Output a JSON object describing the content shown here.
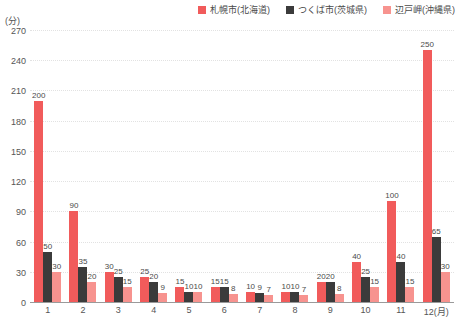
{
  "chart_data": {
    "type": "bar",
    "title": "",
    "subtitle": "",
    "xlabel": "",
    "ylabel": "(分)",
    "unit_label": "(分)",
    "categories": [
      "1",
      "2",
      "3",
      "4",
      "5",
      "6",
      "7",
      "8",
      "9",
      "10",
      "11",
      "12(月)"
    ],
    "ylim": [
      0,
      270
    ],
    "ytick_step": 30,
    "yticks": [
      "0",
      "30",
      "60",
      "90",
      "120",
      "150",
      "180",
      "210",
      "240",
      "270"
    ],
    "grid": true,
    "legend_position": "top-right",
    "series": [
      {
        "name": "札幌市(北海道)",
        "color": "#f15b5b",
        "values": [
          200,
          90,
          30,
          25,
          15,
          15,
          10,
          10,
          20,
          40,
          100,
          250
        ]
      },
      {
        "name": "つくば市(茨城県)",
        "color": "#3b3b3b",
        "values": [
          50,
          35,
          25,
          20,
          10,
          15,
          9,
          10,
          20,
          25,
          40,
          65
        ]
      },
      {
        "name": "辺戸岬(沖縄県)",
        "color": "#f7938f",
        "values": [
          30,
          20,
          15,
          9,
          10,
          8,
          7,
          7,
          8,
          15,
          15,
          30
        ]
      }
    ]
  }
}
